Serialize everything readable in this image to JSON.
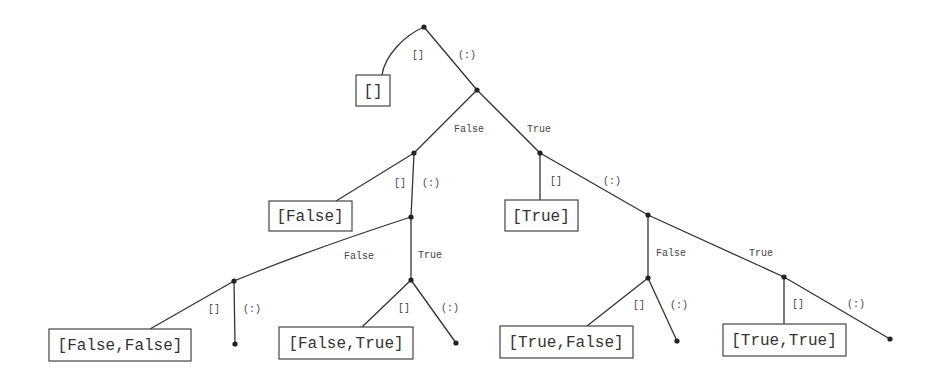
{
  "diagram": {
    "type": "decision-tree",
    "nodes": [
      {
        "id": "root",
        "x": 424,
        "y": 27
      },
      {
        "id": "n1",
        "x": 477,
        "y": 90
      },
      {
        "id": "nF",
        "x": 414,
        "y": 153
      },
      {
        "id": "nT",
        "x": 540,
        "y": 153
      },
      {
        "id": "nFc",
        "x": 411,
        "y": 217
      },
      {
        "id": "nTc",
        "x": 648,
        "y": 215
      },
      {
        "id": "nFF",
        "x": 234,
        "y": 281
      },
      {
        "id": "nFT",
        "x": 411,
        "y": 280
      },
      {
        "id": "nTF",
        "x": 648,
        "y": 278
      },
      {
        "id": "nTT",
        "x": 784,
        "y": 277
      },
      {
        "id": "leafFF",
        "x": 235,
        "y": 344
      },
      {
        "id": "leafFT",
        "x": 456,
        "y": 343
      },
      {
        "id": "leafTF",
        "x": 677,
        "y": 341
      },
      {
        "id": "leafTT",
        "x": 890,
        "y": 339
      }
    ],
    "boxes": [
      {
        "label": "[]",
        "x": 356,
        "y": 75,
        "w": 34,
        "h": 31
      },
      {
        "label": "[False]",
        "x": 269,
        "y": 201,
        "w": 83,
        "h": 30
      },
      {
        "label": "[True]",
        "x": 505,
        "y": 200,
        "w": 73,
        "h": 31
      },
      {
        "label": "[False,False]",
        "x": 49,
        "y": 329,
        "w": 142,
        "h": 32
      },
      {
        "label": "[False,True]",
        "x": 279,
        "y": 327,
        "w": 134,
        "h": 32
      },
      {
        "label": "[True,False]",
        "x": 500,
        "y": 326,
        "w": 133,
        "h": 32
      },
      {
        "label": "[True,True]",
        "x": 723,
        "y": 324,
        "w": 123,
        "h": 32
      }
    ],
    "edge_labels": [
      {
        "text": "[]",
        "x": 412,
        "y": 58
      },
      {
        "text": "(:)",
        "x": 458,
        "y": 58
      },
      {
        "text": "False",
        "x": 454,
        "y": 132
      },
      {
        "text": "True",
        "x": 527,
        "y": 132
      },
      {
        "text": "[]",
        "x": 394,
        "y": 186
      },
      {
        "text": "(:)",
        "x": 422,
        "y": 186
      },
      {
        "text": "[]",
        "x": 550,
        "y": 184
      },
      {
        "text": "(:)",
        "x": 603,
        "y": 184
      },
      {
        "text": "False",
        "x": 344,
        "y": 259
      },
      {
        "text": "True",
        "x": 418,
        "y": 258
      },
      {
        "text": "False",
        "x": 656,
        "y": 256
      },
      {
        "text": "True",
        "x": 749,
        "y": 256
      },
      {
        "text": "[]",
        "x": 208,
        "y": 312
      },
      {
        "text": "(:)",
        "x": 243,
        "y": 312
      },
      {
        "text": "[]",
        "x": 398,
        "y": 311
      },
      {
        "text": "(:)",
        "x": 441,
        "y": 311
      },
      {
        "text": "[]",
        "x": 633,
        "y": 308
      },
      {
        "text": "(:)",
        "x": 670,
        "y": 308
      },
      {
        "text": "[]",
        "x": 792,
        "y": 307
      },
      {
        "text": "(:)",
        "x": 847,
        "y": 307
      }
    ]
  }
}
